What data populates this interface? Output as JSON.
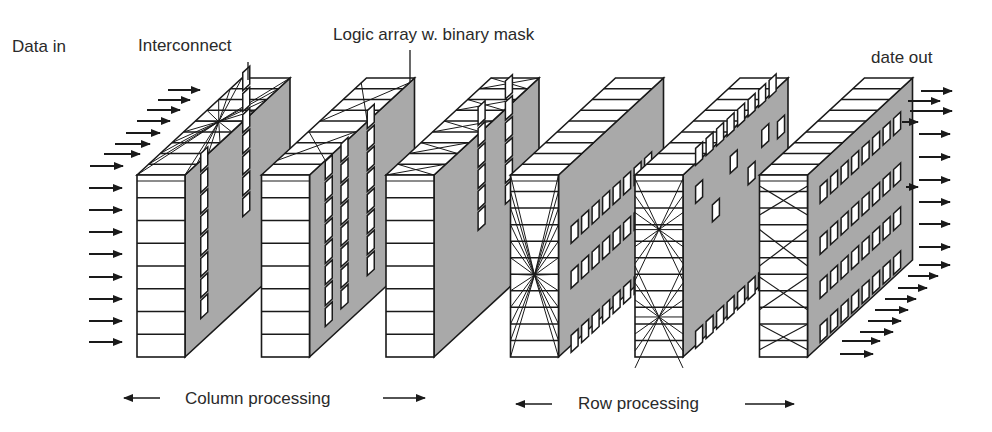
{
  "labels": {
    "data_in": "Data in",
    "interconnect": "Interconnect",
    "logic_array": "Logic array w. binary mask",
    "data_out": "date out",
    "column_processing": "Column processing",
    "row_processing": "Row processing"
  },
  "colors": {
    "stroke": "#1a1a1a",
    "face_fill": "#ffffff",
    "side_fill": "#a9a9a9",
    "text": "#2a2a2a"
  },
  "stages": [
    {
      "id": 1,
      "group": "column",
      "front_pattern": "rows",
      "top_pattern": "star",
      "side_pattern": "two-columns"
    },
    {
      "id": 2,
      "group": "column",
      "front_pattern": "rows",
      "top_pattern": "crossed",
      "side_pattern": "three-columns"
    },
    {
      "id": 3,
      "group": "column",
      "front_pattern": "rows",
      "top_pattern": "x-cells",
      "side_pattern": "two-columns"
    },
    {
      "id": 4,
      "group": "row",
      "front_pattern": "star",
      "top_pattern": "rows",
      "side_pattern": "three-rows"
    },
    {
      "id": 5,
      "group": "row",
      "front_pattern": "double-star",
      "top_pattern": "rows",
      "side_pattern": "scattered"
    },
    {
      "id": 6,
      "group": "row",
      "front_pattern": "x-cells",
      "top_pattern": "rows",
      "side_pattern": "four-rows"
    }
  ]
}
